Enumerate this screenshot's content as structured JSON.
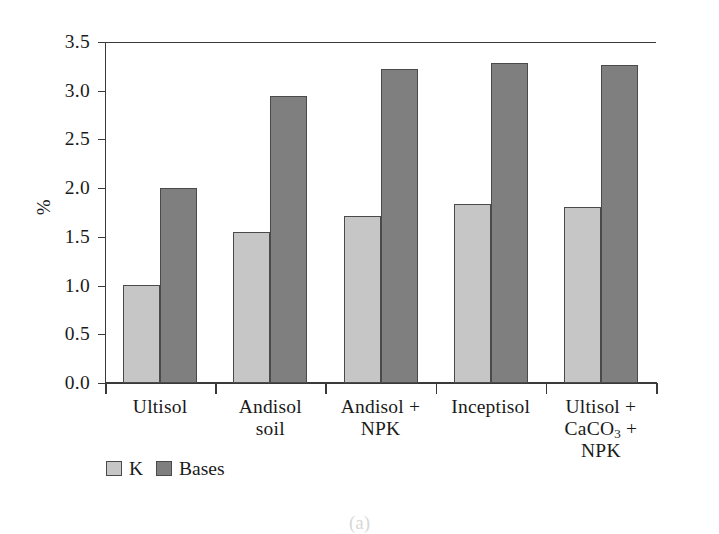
{
  "chart_data": {
    "type": "bar",
    "title": "",
    "xlabel": "",
    "ylabel": "%",
    "ylim": [
      0.0,
      3.5
    ],
    "ytick_labels": [
      "0.0",
      "0.5",
      "1.0",
      "1.5",
      "2.0",
      "2.5",
      "3.0",
      "3.5"
    ],
    "ytick_values": [
      0.0,
      0.5,
      1.0,
      1.5,
      2.0,
      2.5,
      3.0,
      3.5
    ],
    "grid": false,
    "legend_position": "below-left",
    "categories": [
      "Ultisol",
      "Andisol soil",
      "Andisol + NPK",
      "Inceptisol",
      "Ultisol + CaCO3 + NPK"
    ],
    "category_lines": [
      [
        "Ultisol"
      ],
      [
        "Andisol",
        "soil"
      ],
      [
        "Andisol +",
        "NPK"
      ],
      [
        "Inceptisol"
      ],
      [
        "Ultisol +",
        "CaCO3 +",
        "NPK"
      ]
    ],
    "series": [
      {
        "name": "K",
        "color": "#c6c6c6",
        "values": [
          1.01,
          1.55,
          1.71,
          1.84,
          1.81
        ]
      },
      {
        "name": "Bases",
        "color": "#7f7f7f",
        "values": [
          2.0,
          2.95,
          3.22,
          3.28,
          3.26
        ]
      }
    ]
  },
  "axis": {
    "y_title": "%"
  },
  "legend": {
    "entries": [
      {
        "label": "K",
        "swatch": "light-gray-swatch"
      },
      {
        "label": "Bases",
        "swatch": "dark-gray-swatch"
      }
    ]
  },
  "caption": {
    "text": "(a)"
  },
  "colors": {
    "series_k": "#c6c6c6",
    "series_bases": "#7f7f7f",
    "axis": "#3a3a3a",
    "background": "#ffffff"
  }
}
